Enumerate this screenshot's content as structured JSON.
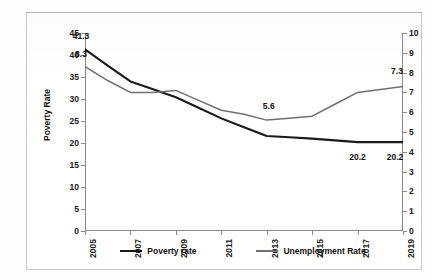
{
  "chart_data": {
    "type": "line",
    "title": "",
    "xlabel": "",
    "grid": false,
    "legend_position": "bottom",
    "x": [
      2005,
      2006,
      2007,
      2008,
      2009,
      2010,
      2011,
      2012,
      2013,
      2014,
      2015,
      2016,
      2017,
      2018,
      2019
    ],
    "x_tick_labels": [
      "2005",
      "2007",
      "2009",
      "2011",
      "2013",
      "2015",
      "2017",
      "2019"
    ],
    "axes": {
      "left": {
        "label": "Poverty Rate",
        "ylim": [
          0,
          45
        ],
        "ticks": [
          0,
          5,
          10,
          15,
          20,
          25,
          30,
          35,
          40,
          45
        ],
        "tick_labels": [
          "0",
          "5",
          "10",
          "15",
          "20",
          "25",
          "30",
          "35",
          "40",
          "45"
        ]
      },
      "right": {
        "label": "Unemployment Rate",
        "ylim": [
          0,
          10
        ],
        "ticks": [
          0,
          1,
          2,
          3,
          4,
          5,
          6,
          7,
          8,
          9,
          10
        ],
        "tick_labels": [
          "0",
          "1",
          "2",
          "3",
          "4",
          "5",
          "6",
          "7",
          "8",
          "9",
          "10"
        ]
      }
    },
    "series": [
      {
        "name": "Poverty rate",
        "axis": "left",
        "color": "#1a1a1a",
        "width": 2.1,
        "values": [
          41.3,
          37.6,
          34.0,
          32.2,
          30.4,
          28.0,
          25.6,
          23.6,
          21.6,
          21.3,
          21.0,
          20.6,
          20.2,
          20.2,
          20.2
        ]
      },
      {
        "name": "Unemployment Rate",
        "axis": "right",
        "color": "#6f6f6f",
        "width": 1.5,
        "values": [
          8.3,
          7.6,
          7.0,
          7.0,
          7.1,
          6.6,
          6.1,
          5.9,
          5.6,
          5.7,
          5.8,
          6.4,
          7.0,
          7.15,
          7.3
        ]
      }
    ],
    "point_labels": [
      {
        "series": "Poverty rate",
        "x": 2005,
        "value": 41.3,
        "text": "41.3"
      },
      {
        "series": "Unemployment Rate",
        "x": 2005,
        "value": 8.3,
        "text": "8.3"
      },
      {
        "series": "Unemployment Rate",
        "x": 2013,
        "value": 5.6,
        "text": "5.6"
      },
      {
        "series": "Unemployment Rate",
        "x": 2019,
        "value": 7.3,
        "text": "7.3"
      },
      {
        "series": "Poverty rate",
        "x": 2017,
        "value": 20.2,
        "text": "20.2"
      },
      {
        "series": "Poverty rate",
        "x": 2019,
        "value": 20.2,
        "text": "20.2"
      }
    ],
    "legend": [
      {
        "label": "Poverty rate",
        "color": "#1a1a1a"
      },
      {
        "label": "Unemployment Rate",
        "color": "#6f6f6f"
      }
    ]
  }
}
